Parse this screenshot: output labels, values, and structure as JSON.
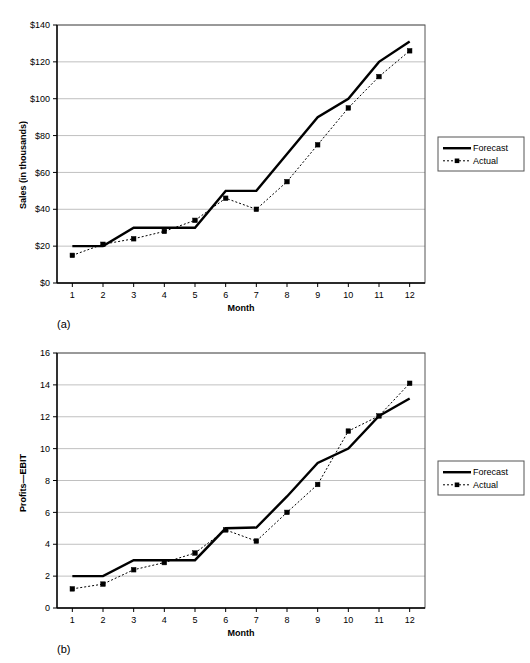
{
  "figure": {
    "panels": [
      {
        "caption": "(a)",
        "y_axis_title": "Sales (in thousands)",
        "x_axis_title": "Month"
      },
      {
        "caption": "(b)",
        "y_axis_title": "Profits—EBIT",
        "x_axis_title": "Month"
      }
    ],
    "legend": {
      "forecast_label": "Forecast",
      "actual_label": "Actual"
    },
    "colors": {
      "line": "#000000",
      "grid": "#b0b0b0",
      "frame": "#555555",
      "background": "#ffffff"
    }
  },
  "chart_data": [
    {
      "type": "line",
      "title": "",
      "panel": "(a)",
      "xlabel": "Month",
      "ylabel": "Sales (in thousands)",
      "x": [
        1,
        2,
        3,
        4,
        5,
        6,
        7,
        8,
        9,
        10,
        11,
        12
      ],
      "categories": [
        "1",
        "2",
        "3",
        "4",
        "5",
        "6",
        "7",
        "8",
        "9",
        "10",
        "11",
        "12"
      ],
      "xtick_labels": [
        "1",
        "2",
        "3",
        "4",
        "5",
        "6",
        "7",
        "8",
        "9",
        "10",
        "11",
        "12"
      ],
      "ytick_labels": [
        "$0",
        "$20",
        "$40",
        "$60",
        "$80",
        "$100",
        "$120",
        "$140"
      ],
      "ytick_values": [
        0,
        20,
        40,
        60,
        80,
        100,
        120,
        140
      ],
      "ylim": [
        0,
        140
      ],
      "xlim": [
        0.5,
        12.5
      ],
      "grid": true,
      "legend_position": "right",
      "series": [
        {
          "name": "Forecast",
          "style": "solid",
          "marker": "none",
          "values": [
            20,
            20,
            30,
            30,
            30,
            50,
            50,
            70,
            90,
            100,
            120,
            131
          ]
        },
        {
          "name": "Actual",
          "style": "dotted",
          "marker": "square",
          "values": [
            15,
            21,
            24,
            28,
            34,
            46,
            40,
            55,
            75,
            95,
            112,
            126
          ]
        }
      ]
    },
    {
      "type": "line",
      "title": "",
      "panel": "(b)",
      "xlabel": "Month",
      "ylabel": "Profits—EBIT",
      "x": [
        1,
        2,
        3,
        4,
        5,
        6,
        7,
        8,
        9,
        10,
        11,
        12
      ],
      "categories": [
        "1",
        "2",
        "3",
        "4",
        "5",
        "6",
        "7",
        "8",
        "9",
        "10",
        "11",
        "12"
      ],
      "xtick_labels": [
        "1",
        "2",
        "3",
        "4",
        "5",
        "6",
        "7",
        "8",
        "9",
        "10",
        "11",
        "12"
      ],
      "ytick_labels": [
        "0",
        "2",
        "4",
        "6",
        "8",
        "10",
        "12",
        "14",
        "16"
      ],
      "ytick_values": [
        0,
        2,
        4,
        6,
        8,
        10,
        12,
        14,
        16
      ],
      "ylim": [
        0,
        16
      ],
      "xlim": [
        0.5,
        12.5
      ],
      "grid": true,
      "legend_position": "right",
      "series": [
        {
          "name": "Forecast",
          "style": "solid",
          "marker": "none",
          "values": [
            2,
            2,
            3,
            3,
            3,
            5,
            5.05,
            7,
            9.1,
            10,
            12.05,
            13.15
          ]
        },
        {
          "name": "Actual",
          "style": "dotted",
          "marker": "square",
          "values": [
            1.2,
            1.5,
            2.4,
            2.85,
            3.45,
            4.9,
            4.2,
            6,
            7.75,
            11.1,
            12.05,
            14.1
          ]
        }
      ]
    }
  ]
}
